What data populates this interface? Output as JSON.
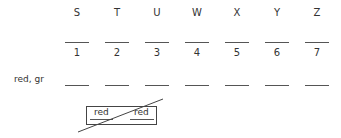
{
  "columns": [
    {
      "letter": "S",
      "number": "1"
    },
    {
      "letter": "T",
      "number": "2"
    },
    {
      "letter": "U",
      "number": "3"
    },
    {
      "letter": "W",
      "number": "4"
    },
    {
      "letter": "X",
      "number": "5"
    },
    {
      "letter": "Y",
      "number": "6"
    },
    {
      "letter": "Z",
      "number": "7"
    }
  ],
  "row": {
    "label": "red, gr"
  },
  "box": {
    "left_word": "red",
    "right_word": "red"
  }
}
